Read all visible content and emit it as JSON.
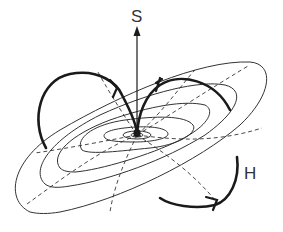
{
  "diagram": {
    "labels": {
      "s": "S",
      "h": "H"
    },
    "elements": {
      "vector_arrow": "S-vector-arrow",
      "field_loops": [
        "left-field-loop",
        "right-field-loop",
        "lower-circulation-arrow"
      ],
      "contours": [
        "contour-outer",
        "contour-2",
        "contour-3",
        "contour-4",
        "contour-5",
        "contour-inner"
      ],
      "dashed_meridians": 5
    },
    "colors": {
      "stroke": "#1a1a1a",
      "thin_stroke": "#333333",
      "background": "#ffffff"
    }
  }
}
